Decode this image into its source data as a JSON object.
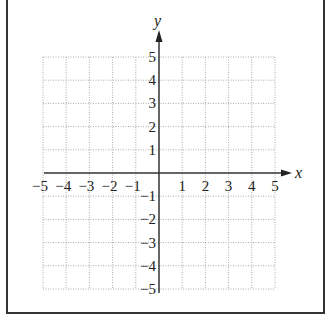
{
  "diagram": {
    "type": "coordinate-plane",
    "x_axis_label": "x",
    "y_axis_label": "y",
    "x_ticks": [
      "−5",
      "−4",
      "−3",
      "−2",
      "−1",
      "1",
      "2",
      "3",
      "4",
      "5"
    ],
    "y_ticks": [
      "5",
      "4",
      "3",
      "2",
      "1",
      "−1",
      "−2",
      "−3",
      "−4",
      "−5"
    ],
    "range": {
      "x": [
        -5,
        5
      ],
      "y": [
        -5,
        5
      ]
    },
    "grid": "dotted",
    "grid_color": "#aaaaaa",
    "axis_color": "#333333"
  }
}
